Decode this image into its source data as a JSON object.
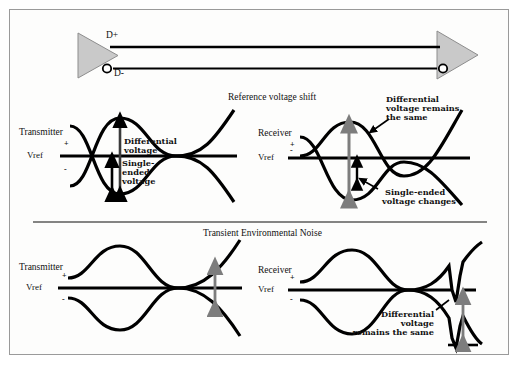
{
  "diagram": {
    "background": "#fdfdfc",
    "border_color": "#9a9a9a",
    "wave_color": "#000000",
    "arrow_gray": "#7d7d7d",
    "triangle_fill": "#c9c9c9"
  },
  "link": {
    "dplus_label": "D+",
    "dminus_label": "D-",
    "driver_name": "driver-triangle",
    "receiver_name": "receiver-triangle"
  },
  "panels": {
    "top": {
      "title": "Reference voltage shift",
      "left": {
        "node_label": "Transmitter",
        "vref_label": "Vref",
        "plus": "+",
        "minus": "-",
        "ann_diff": "Differential\nvoltage",
        "ann_diff_l1": "Differential",
        "ann_diff_l2": "voltage",
        "ann_se_l1": "Single-",
        "ann_se_l2": "ended",
        "ann_se_l3": "voltage"
      },
      "right": {
        "node_label": "Receiver",
        "vref_label": "Vref",
        "plus": "+",
        "minus": "-",
        "ann_diff_l1": "Differential",
        "ann_diff_l2": "voltage remains",
        "ann_diff_l3": "the same",
        "ann_se_l1": "Single-ended",
        "ann_se_l2": "voltage changes"
      }
    },
    "bottom": {
      "title": "Transient Environmental Noise",
      "left": {
        "node_label": "Transmitter",
        "vref_label": "Vref",
        "plus": "+",
        "minus": "-"
      },
      "right": {
        "node_label": "Receiver",
        "vref_label": "Vref",
        "plus": "+",
        "minus": "-",
        "ann_diff_l1": "Differential",
        "ann_diff_l2": "voltage",
        "ann_diff_l3": "remains the same"
      }
    }
  }
}
